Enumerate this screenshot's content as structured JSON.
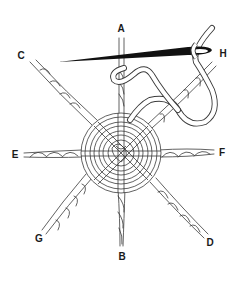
{
  "diagram": {
    "labels": [
      {
        "id": "A",
        "text": "A",
        "x": 121,
        "y": 29
      },
      {
        "id": "B",
        "text": "B",
        "x": 122,
        "y": 257
      },
      {
        "id": "C",
        "text": "C",
        "x": 21,
        "y": 56
      },
      {
        "id": "D",
        "text": "D",
        "x": 210,
        "y": 243
      },
      {
        "id": "E",
        "text": "E",
        "x": 15,
        "y": 155
      },
      {
        "id": "F",
        "text": "F",
        "x": 222,
        "y": 153
      },
      {
        "id": "G",
        "text": "G",
        "x": 39,
        "y": 239
      },
      {
        "id": "H",
        "text": "H",
        "x": 223,
        "y": 54
      }
    ],
    "colors": {
      "ink": "#3a3a3a",
      "needle": "#111111",
      "thread_fill": "#ffffff",
      "background": "#ffffff"
    }
  }
}
